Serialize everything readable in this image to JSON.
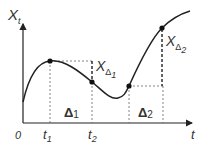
{
  "diagram": {
    "type": "process-increment-illustration",
    "axes": {
      "y_label": "X",
      "y_label_sub": "t",
      "x_label": "t",
      "origin_label": "0"
    },
    "ticks": [
      {
        "label": "t",
        "sub": "1"
      },
      {
        "label": "t",
        "sub": "2"
      }
    ],
    "intervals": [
      {
        "label": "Δ",
        "sub": "1"
      },
      {
        "label": "Δ",
        "sub": "2"
      }
    ],
    "increments": [
      {
        "label": "X",
        "sub_delta": "Δ",
        "sub_index": "1"
      },
      {
        "label": "X",
        "sub_delta": "Δ",
        "sub_index": "2"
      }
    ],
    "colors": {
      "line": "#222222",
      "dashed": "#555555",
      "text": "#333333"
    }
  }
}
